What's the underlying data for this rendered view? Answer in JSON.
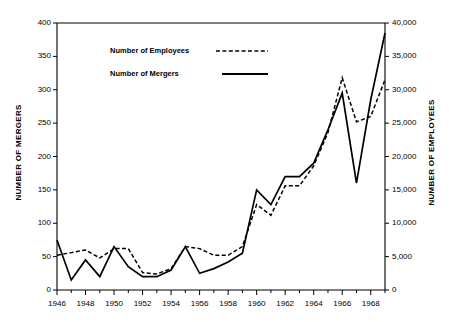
{
  "chart_data": {
    "type": "line",
    "title": "",
    "xlabel": "",
    "ylabel": "NUMBER OF MERGERS",
    "ylabel_right": "NUMBER OF EMPLOYEES",
    "x": [
      1946,
      1947,
      1948,
      1949,
      1950,
      1951,
      1952,
      1953,
      1954,
      1955,
      1956,
      1957,
      1958,
      1959,
      1960,
      1961,
      1962,
      1963,
      1964,
      1965,
      1966,
      1967,
      1968,
      1969
    ],
    "xlim": [
      1946,
      1969
    ],
    "ylim": [
      0,
      400
    ],
    "ylim_right": [
      0,
      40000
    ],
    "xticks": [
      1946,
      1948,
      1950,
      1952,
      1954,
      1956,
      1958,
      1960,
      1962,
      1964,
      1966,
      1968
    ],
    "xticklabels": [
      "1946",
      "1948",
      "1950",
      "1952",
      "1954",
      "1956",
      "1958",
      "1960",
      "1962",
      "1964",
      "1966",
      "1968"
    ],
    "yticks": [
      0,
      50,
      100,
      150,
      200,
      250,
      300,
      350,
      400
    ],
    "yticklabels": [
      "0",
      "50",
      "100",
      "150",
      "200",
      "250",
      "300",
      "350",
      "400"
    ],
    "yticks_right": [
      0,
      5000,
      10000,
      15000,
      20000,
      25000,
      30000,
      35000,
      40000
    ],
    "yticklabels_right": [
      "0",
      "5,000",
      "10,000",
      "15,000",
      "20,000",
      "25,000",
      "30,000",
      "35,000",
      "40,000"
    ],
    "grid": false,
    "legend_position": "upper-left-inside",
    "series": [
      {
        "name": "Number of Employees",
        "axis": "right",
        "style": "dashed",
        "color": "#000000",
        "values": [
          5200,
          5600,
          6000,
          4800,
          6200,
          6200,
          2600,
          2400,
          3200,
          6500,
          6200,
          5200,
          5200,
          6500,
          12800,
          11200,
          15600,
          15600,
          18600,
          23600,
          31800,
          25200,
          26000,
          31500
        ]
      },
      {
        "name": "Number of Mergers",
        "axis": "left",
        "style": "solid",
        "color": "#000000",
        "values": [
          75,
          15,
          45,
          20,
          65,
          35,
          20,
          20,
          30,
          65,
          25,
          32,
          42,
          55,
          150,
          128,
          170,
          170,
          190,
          240,
          295,
          160,
          285,
          385
        ]
      }
    ],
    "legend": [
      {
        "label": "Number of Employees",
        "style": "dashed"
      },
      {
        "label": "Number of Mergers",
        "style": "solid"
      }
    ]
  }
}
